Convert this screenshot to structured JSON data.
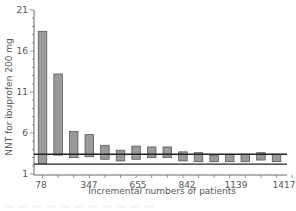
{
  "chart_data": {
    "type": "bar",
    "subtype": "floating-range-bar",
    "title": "",
    "xlabel": "Incremental numbers of patients",
    "ylabel": "NNT for ibuprofen 200 mg",
    "ylim": [
      1,
      21
    ],
    "yticks": [
      1,
      6,
      11,
      16,
      21
    ],
    "xtick_labels": [
      "78",
      "347",
      "655",
      "842",
      "1139",
      "1417"
    ],
    "grid": false,
    "legend": null,
    "series": [
      {
        "name": "NNT range",
        "bars": [
          {
            "low": 2.3,
            "high": 18.4
          },
          {
            "low": 3.3,
            "high": 13.2
          },
          {
            "low": 3.0,
            "high": 6.2
          },
          {
            "low": 3.1,
            "high": 5.8
          },
          {
            "low": 2.8,
            "high": 4.5
          },
          {
            "low": 2.6,
            "high": 3.9
          },
          {
            "low": 2.8,
            "high": 4.4
          },
          {
            "low": 3.0,
            "high": 4.3
          },
          {
            "low": 3.0,
            "high": 4.3
          },
          {
            "low": 2.6,
            "high": 3.7
          },
          {
            "low": 2.5,
            "high": 3.6
          },
          {
            "low": 2.5,
            "high": 3.3
          },
          {
            "low": 2.5,
            "high": 3.4
          },
          {
            "low": 2.5,
            "high": 3.4
          },
          {
            "low": 2.7,
            "high": 3.6
          },
          {
            "low": 2.5,
            "high": 3.4
          }
        ]
      }
    ],
    "reference_lines": [
      3.4,
      2.2
    ],
    "colors": {
      "bar_fill": "#9a9a9a",
      "bar_stroke": "#555555",
      "line": "#222222",
      "axis": "#666666"
    }
  }
}
